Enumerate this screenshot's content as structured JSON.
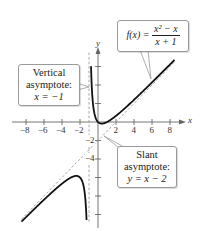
{
  "chart_data": {
    "type": "line",
    "title": "",
    "xlabel": "x",
    "ylabel": "y",
    "xlim": [
      -9,
      9.5
    ],
    "ylim": [
      -11,
      7.5
    ],
    "x_ticks": [
      -8,
      -6,
      -4,
      -2,
      2,
      4,
      6,
      8
    ],
    "y_ticks_labeled": [
      -2,
      -4
    ],
    "y_ticks": [
      6,
      4,
      2,
      -2,
      -4,
      -6,
      -8,
      -10
    ],
    "grid": false,
    "series": [
      {
        "name": "f(x) = (x^2 - x)/(x + 1)",
        "style": "solid",
        "color": "#111111",
        "function": "(x^2 - x)/(x + 1)",
        "domain_left": [
          -8.5,
          -1.05
        ],
        "domain_right": [
          -0.93,
          8.5
        ]
      },
      {
        "name": "Slant asymptote y = x - 2",
        "style": "dashed",
        "color": "#999999",
        "function": "x - 2"
      },
      {
        "name": "Vertical asymptote x = -1",
        "style": "dashed",
        "color": "#999999",
        "x": -1
      }
    ],
    "annotations": [
      {
        "text": "f(x) = (x^2 - x)/(x + 1)",
        "target": "right branch"
      },
      {
        "text": "Vertical asymptote: x = -1",
        "target": "x = -1"
      },
      {
        "text": "Slant asymptote: y = x - 2",
        "target": "y = x - 2"
      }
    ]
  },
  "labels": {
    "x_axis": "x",
    "y_axis": "y",
    "x_tick_labels": [
      "−8",
      "−6",
      "−4",
      "−2",
      "2",
      "4",
      "6",
      "8"
    ],
    "y_tick_labels": [
      "−2",
      "−4"
    ]
  },
  "callouts": {
    "vertical": {
      "line1": "Vertical",
      "line2": "asymptote:",
      "line3": "x = −1"
    },
    "slant": {
      "line1": "Slant",
      "line2": "asymptote:",
      "line3": "y = x − 2"
    },
    "function": {
      "lhs": "f(x) =",
      "numerator": "x² − x",
      "denominator": "x + 1"
    }
  }
}
